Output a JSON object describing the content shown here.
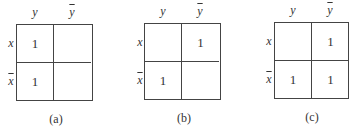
{
  "maps": [
    {
      "id": "a",
      "caption": "(a)",
      "col_labels": [
        "y",
        "y"
      ],
      "col_bars": [
        false,
        true
      ],
      "row_labels": [
        "x",
        "x"
      ],
      "row_bars": [
        false,
        true
      ],
      "cells": [
        [
          "1",
          ""
        ],
        [
          "1",
          ""
        ]
      ]
    },
    {
      "id": "b",
      "caption": "(b)",
      "col_labels": [
        "y",
        "y"
      ],
      "col_bars": [
        false,
        true
      ],
      "row_labels": [
        "x",
        "x"
      ],
      "row_bars": [
        false,
        true
      ],
      "cells": [
        [
          "",
          "1"
        ],
        [
          "1",
          ""
        ]
      ]
    },
    {
      "id": "c",
      "caption": "(c)",
      "col_labels": [
        "y",
        "y"
      ],
      "col_bars": [
        false,
        true
      ],
      "row_labels": [
        "x",
        "x"
      ],
      "row_bars": [
        false,
        true
      ],
      "cells": [
        [
          "",
          "1"
        ],
        [
          "1",
          "1"
        ]
      ]
    }
  ]
}
